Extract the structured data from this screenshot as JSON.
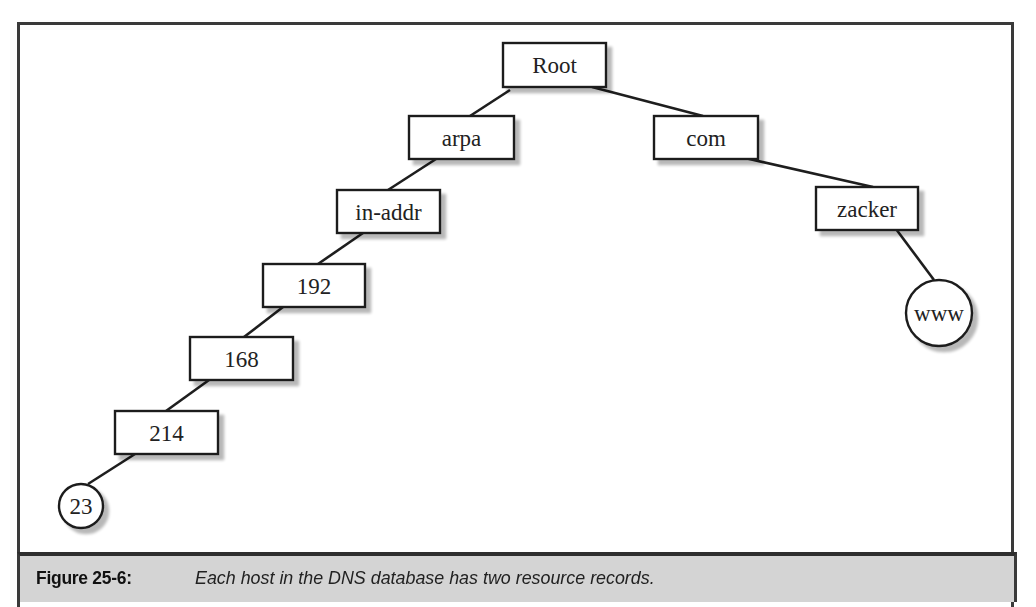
{
  "figure": {
    "label": "Figure 25-6:",
    "caption": "Each host in the DNS database has two resource records."
  },
  "colors": {
    "line": "#1e1e1e",
    "shadow": "#c8c8c8",
    "caption_bg": "#d4d4d4",
    "frame": "#3a3a3a"
  },
  "nodes": [
    {
      "id": "root",
      "label": "Root",
      "shape": "box",
      "x": 503,
      "y": 43,
      "w": 103,
      "h": 44
    },
    {
      "id": "arpa",
      "label": "arpa",
      "shape": "box",
      "x": 409,
      "y": 116,
      "w": 105,
      "h": 43
    },
    {
      "id": "com",
      "label": "com",
      "shape": "box",
      "x": 654,
      "y": 116,
      "w": 104,
      "h": 43
    },
    {
      "id": "in-addr",
      "label": "in-addr",
      "shape": "box",
      "x": 337,
      "y": 190,
      "w": 103,
      "h": 43
    },
    {
      "id": "zacker",
      "label": "zacker",
      "shape": "box",
      "x": 816,
      "y": 187,
      "w": 102,
      "h": 43
    },
    {
      "id": "192",
      "label": "192",
      "shape": "box",
      "x": 263,
      "y": 264,
      "w": 102,
      "h": 43
    },
    {
      "id": "168",
      "label": "168",
      "shape": "box",
      "x": 190,
      "y": 337,
      "w": 103,
      "h": 43
    },
    {
      "id": "214",
      "label": "214",
      "shape": "box",
      "x": 115,
      "y": 411,
      "w": 103,
      "h": 43
    },
    {
      "id": "www",
      "label": "www",
      "shape": "circle",
      "cx": 939,
      "cy": 313,
      "r": 33
    },
    {
      "id": "23",
      "label": "23",
      "shape": "circle",
      "cx": 81,
      "cy": 506,
      "r": 22
    }
  ],
  "edges": [
    {
      "from": "root",
      "to": "arpa",
      "x1": 510,
      "y1": 90,
      "x2": 470,
      "y2": 116
    },
    {
      "from": "root",
      "to": "com",
      "x1": 592,
      "y1": 87,
      "x2": 703,
      "y2": 116
    },
    {
      "from": "arpa",
      "to": "in-addr",
      "x1": 436,
      "y1": 159,
      "x2": 388,
      "y2": 190
    },
    {
      "from": "com",
      "to": "zacker",
      "x1": 745,
      "y1": 158,
      "x2": 873,
      "y2": 187
    },
    {
      "from": "in-addr",
      "to": "192",
      "x1": 363,
      "y1": 233,
      "x2": 318,
      "y2": 264
    },
    {
      "from": "zacker",
      "to": "www",
      "x1": 896,
      "y1": 229,
      "x2": 934,
      "y2": 280
    },
    {
      "from": "192",
      "to": "168",
      "x1": 283,
      "y1": 307,
      "x2": 244,
      "y2": 337
    },
    {
      "from": "168",
      "to": "214",
      "x1": 209,
      "y1": 380,
      "x2": 166,
      "y2": 411
    },
    {
      "from": "214",
      "to": "23",
      "x1": 135,
      "y1": 454,
      "x2": 88,
      "y2": 484
    }
  ]
}
